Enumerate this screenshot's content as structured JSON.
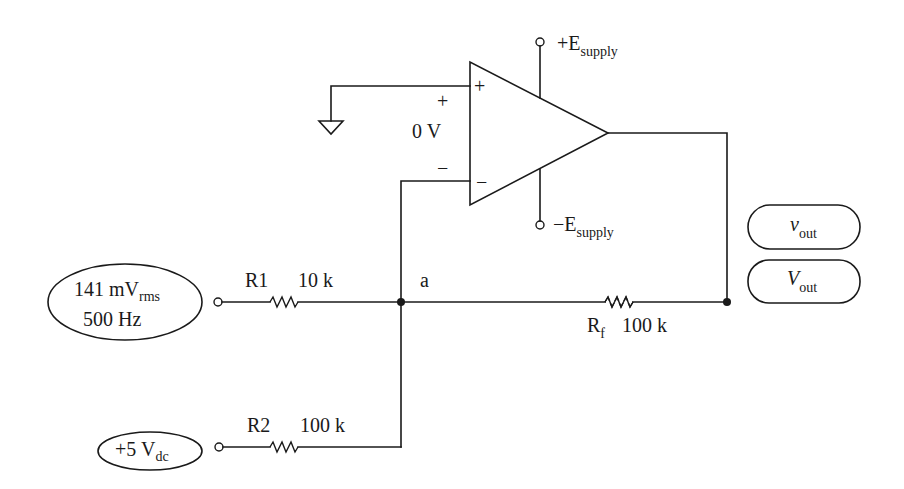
{
  "diagram": {
    "type": "inverting summing amplifier (op-amp)",
    "opamp": {
      "noninverting_input_symbol": "+",
      "inverting_input_symbol": "−",
      "positive_supply": {
        "prefix": "+E",
        "subscript": "supply"
      },
      "negative_supply": {
        "prefix": "−E",
        "subscript": "supply"
      },
      "differential_voltage": {
        "plus": "+",
        "value": "0 V",
        "minus": "−"
      }
    },
    "ground": {
      "connected_to": "noninverting input"
    },
    "sources": [
      {
        "id": "ac_source",
        "line1_main": "141 mV",
        "line1_sub": "rms",
        "line2": "500 Hz"
      },
      {
        "id": "dc_source",
        "main": "+5 V",
        "sub": "dc"
      }
    ],
    "resistors": [
      {
        "name": "R1",
        "value": "10 k"
      },
      {
        "name": "R2",
        "value": "100 k"
      },
      {
        "name_main": "R",
        "name_sub": "f",
        "value": "100 k"
      }
    ],
    "nodes": {
      "summing_node": "a"
    },
    "outputs": [
      {
        "main": "v",
        "sub": "out",
        "kind": "ac"
      },
      {
        "main": "V",
        "sub": "out",
        "kind": "dc"
      }
    ],
    "colors": {
      "line": "#1a1a1a",
      "background": "#ffffff"
    }
  }
}
